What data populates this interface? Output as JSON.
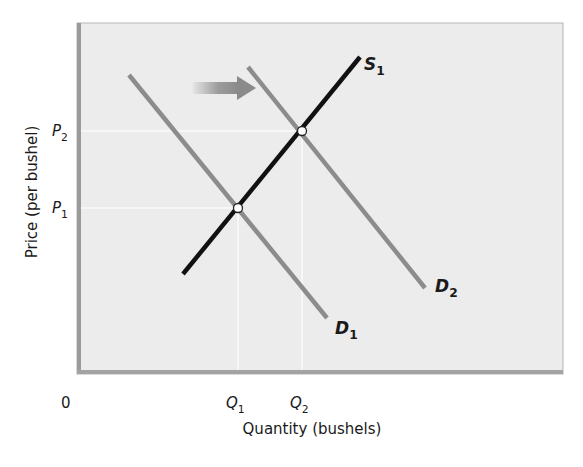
{
  "chart_data": {
    "type": "line",
    "title": "",
    "xlabel": "Quantity (bushels)",
    "ylabel": "Price (per bushel)",
    "origin_label": "0",
    "x_ticks": [
      {
        "label": "Q",
        "sub": "1",
        "x": 238
      },
      {
        "label": "Q",
        "sub": "2",
        "x": 302
      }
    ],
    "y_ticks": [
      {
        "label": "P",
        "sub": "2",
        "y": 131
      },
      {
        "label": "P",
        "sub": "1",
        "y": 208
      }
    ],
    "series": [
      {
        "name": "S1",
        "label": "S",
        "sub": "1",
        "role": "supply",
        "color": "#111111",
        "points": [
          [
            183,
            274
          ],
          [
            360,
            57
          ]
        ],
        "label_pos": [
          364,
          70
        ]
      },
      {
        "name": "D1",
        "label": "D",
        "sub": "1",
        "role": "demand (initial)",
        "color": "#8c8c8c",
        "points": [
          [
            129,
            75
          ],
          [
            327,
            318
          ]
        ],
        "label_pos": [
          335,
          334
        ]
      },
      {
        "name": "D2",
        "label": "D",
        "sub": "2",
        "role": "demand (shifted right)",
        "color": "#8c8c8c",
        "points": [
          [
            248,
            67
          ],
          [
            425,
            288
          ]
        ],
        "label_pos": [
          435,
          292
        ]
      }
    ],
    "equilibria": [
      {
        "name": "E1",
        "x": 238,
        "y": 208,
        "price": "P1",
        "quantity": "Q1"
      },
      {
        "name": "E2",
        "x": 302,
        "y": 131,
        "price": "P2",
        "quantity": "Q2"
      }
    ],
    "annotations": [
      {
        "type": "arrow",
        "direction": "right",
        "meaning": "demand increases (shift from D1 to D2)",
        "x1": 193,
        "x2": 256,
        "y": 88
      }
    ],
    "grid": false,
    "legend": "none (curves labeled directly)",
    "colors": {
      "plot_bg": "#ececec",
      "frame_dark": "#9a9a9a",
      "supply": "#111111",
      "demand": "#8c8c8c",
      "guide_lines": "#ffffff",
      "arrow": "#8a8a8a"
    }
  }
}
